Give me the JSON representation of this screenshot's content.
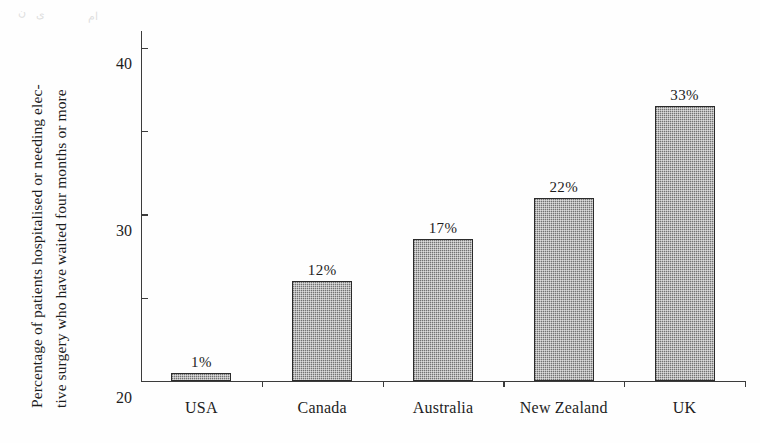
{
  "figure": {
    "background_color": "#fefefe",
    "ink_color": "#1d1d1d",
    "artifacts": [
      {
        "text": "ن",
        "x": 18,
        "y": 6
      },
      {
        "text": "ی",
        "x": 36,
        "y": 8
      },
      {
        "text": "ام",
        "x": 88,
        "y": 10
      }
    ]
  },
  "axis": {
    "y_label_line1": "Percentage of patients hospitalised or needing elec-",
    "y_label_line2": "tive surgery who have waited four months or more",
    "y_ticks": [
      "0",
      "10",
      "20",
      "30",
      "40"
    ],
    "y_tick_values": [
      0,
      10,
      20,
      30,
      40
    ]
  },
  "chart_data": {
    "type": "bar",
    "title": "",
    "subtitle": "",
    "xlabel": "",
    "ylabel": "Percentage of patients hospitalised or needing elective surgery who have waited four months or more",
    "categories": [
      "USA",
      "Canada",
      "Australia",
      "New Zealand",
      "UK"
    ],
    "values": [
      1,
      12,
      17,
      22,
      33
    ],
    "value_labels": [
      "1%",
      "12%",
      "17%",
      "22%",
      "33%"
    ],
    "ylim": [
      0,
      42
    ],
    "ytick_values": [
      0,
      10,
      20,
      30,
      40
    ],
    "ytick_labels": [
      "0",
      "10",
      "20",
      "30",
      "40"
    ],
    "grid": false,
    "legend": false,
    "bar_fill_color": "#9a9a9a",
    "bar_edge_color": "#2b2b2b",
    "axis_color": "#3c3c3c"
  }
}
